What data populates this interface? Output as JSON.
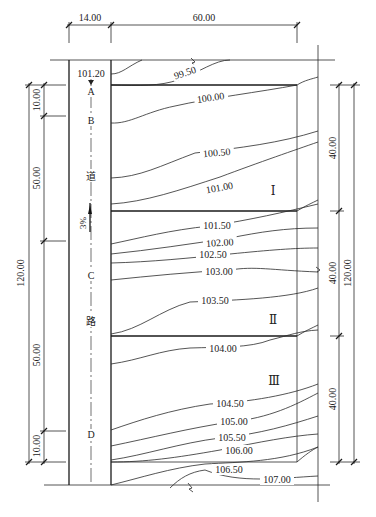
{
  "dimensions": {
    "top": [
      {
        "label": "14.00"
      },
      {
        "label": "60.00"
      }
    ],
    "left_outer": {
      "label": "120.00"
    },
    "left_inner": [
      {
        "label": "10.00"
      },
      {
        "label": "50.00"
      },
      {
        "label": "50.00"
      },
      {
        "label": "10.00"
      }
    ],
    "right_inner": [
      {
        "label": "40.00"
      },
      {
        "label": "40.00"
      },
      {
        "label": "40.00"
      }
    ],
    "right_outer": {
      "label": "120.00"
    }
  },
  "road": {
    "start_elevation": "101.20",
    "stations": [
      "A",
      "B",
      "C",
      "D"
    ],
    "name_chars": [
      "道",
      "路"
    ],
    "slope": "3%"
  },
  "zones": [
    "Ⅰ",
    "Ⅱ",
    "Ⅲ"
  ],
  "contours": [
    {
      "label": "99.50"
    },
    {
      "label": "100.00"
    },
    {
      "label": "100.50"
    },
    {
      "label": "101.00"
    },
    {
      "label": "101.50"
    },
    {
      "label": "102.00"
    },
    {
      "label": "102.50"
    },
    {
      "label": "103.00"
    },
    {
      "label": "103.50"
    },
    {
      "label": "104.00"
    },
    {
      "label": "104.50"
    },
    {
      "label": "105.00"
    },
    {
      "label": "105.50"
    },
    {
      "label": "106.00"
    },
    {
      "label": "106.50"
    },
    {
      "label": "107.00"
    }
  ]
}
